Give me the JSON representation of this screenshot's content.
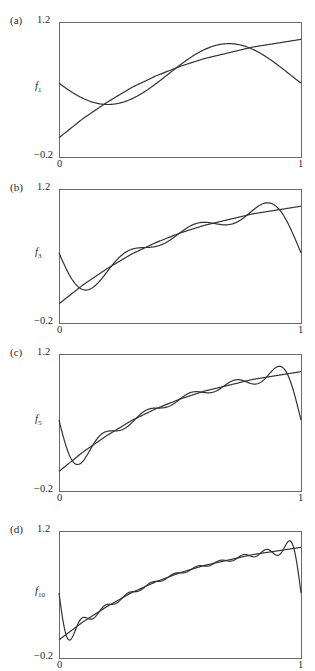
{
  "chart_data": [
    {
      "type": "line",
      "panel_label": "(a)",
      "ylabel_base": "f",
      "ylabel_sub": "1",
      "n_terms": 1,
      "xlim": [
        0,
        1
      ],
      "ylim": [
        -0.2,
        1.2
      ],
      "xtick_labels": [
        "0",
        "1"
      ],
      "ytick_labels": [
        "1.2",
        "−0.2"
      ],
      "grid": false,
      "legend": null,
      "series": [
        {
          "name": "target function",
          "x": [
            0,
            0.1,
            0.2,
            0.3,
            0.4,
            0.5,
            0.6,
            0.7,
            0.8,
            0.9,
            1.0
          ],
          "values": [
            0.0,
            0.2,
            0.37,
            0.52,
            0.64,
            0.74,
            0.82,
            0.88,
            0.94,
            0.98,
            1.02
          ]
        },
        {
          "name": "f1",
          "x": [
            0,
            0.22,
            0.5,
            0.7,
            1.0
          ],
          "values": [
            0.57,
            0.34,
            0.73,
            1.0,
            0.57
          ]
        }
      ]
    },
    {
      "type": "line",
      "panel_label": "(b)",
      "ylabel_base": "f",
      "ylabel_sub": "3",
      "n_terms": 3,
      "xlim": [
        0,
        1
      ],
      "ylim": [
        -0.2,
        1.2
      ],
      "xtick_labels": [
        "0",
        "1"
      ],
      "ytick_labels": [
        "1.2",
        "−0.2"
      ],
      "grid": false,
      "legend": null,
      "series": [
        {
          "name": "target function",
          "x": [
            0,
            0.1,
            0.2,
            0.3,
            0.4,
            0.5,
            0.6,
            0.7,
            0.8,
            0.9,
            1.0
          ],
          "values": [
            0.0,
            0.2,
            0.37,
            0.52,
            0.64,
            0.74,
            0.82,
            0.88,
            0.94,
            0.98,
            1.02
          ]
        },
        {
          "name": "f3",
          "x": [
            0,
            0.1,
            0.3,
            0.5,
            0.7,
            0.9,
            1.0
          ],
          "values": [
            0.57,
            0.13,
            0.56,
            0.8,
            0.84,
            1.1,
            0.55
          ]
        }
      ]
    },
    {
      "type": "line",
      "panel_label": "(c)",
      "ylabel_base": "f",
      "ylabel_sub": "5",
      "n_terms": 5,
      "xlim": [
        0,
        1
      ],
      "ylim": [
        -0.2,
        1.2
      ],
      "xtick_labels": [
        "0",
        "1"
      ],
      "ytick_labels": [
        "1.2",
        "−0.2"
      ],
      "grid": false,
      "legend": null,
      "series": [
        {
          "name": "target function",
          "x": [
            0,
            0.1,
            0.2,
            0.3,
            0.4,
            0.5,
            0.6,
            0.7,
            0.8,
            0.9,
            1.0
          ],
          "values": [
            0.0,
            0.2,
            0.37,
            0.52,
            0.64,
            0.74,
            0.82,
            0.88,
            0.94,
            0.98,
            1.02
          ]
        },
        {
          "name": "f5",
          "x": [
            0,
            0.07,
            0.2,
            0.5,
            0.8,
            0.93,
            1.0
          ],
          "values": [
            0.57,
            0.1,
            0.4,
            0.75,
            0.96,
            1.1,
            0.55
          ]
        }
      ]
    },
    {
      "type": "line",
      "panel_label": "(d)",
      "ylabel_base": "f",
      "ylabel_sub": "10",
      "n_terms": 10,
      "xlim": [
        0,
        1
      ],
      "ylim": [
        -0.2,
        1.2
      ],
      "xtick_labels": [
        "0",
        "1"
      ],
      "ytick_labels": [
        "1.2",
        "−0.2"
      ],
      "grid": false,
      "legend": null,
      "series": [
        {
          "name": "target function",
          "x": [
            0,
            0.1,
            0.2,
            0.3,
            0.4,
            0.5,
            0.6,
            0.7,
            0.8,
            0.9,
            1.0
          ],
          "values": [
            0.0,
            0.2,
            0.37,
            0.52,
            0.64,
            0.74,
            0.82,
            0.88,
            0.94,
            0.98,
            1.02
          ]
        },
        {
          "name": "f10",
          "x": [
            0,
            0.04,
            0.2,
            0.5,
            0.8,
            0.96,
            1.0
          ],
          "values": [
            0.57,
            0.06,
            0.35,
            0.75,
            0.96,
            1.1,
            0.5
          ]
        }
      ]
    }
  ]
}
